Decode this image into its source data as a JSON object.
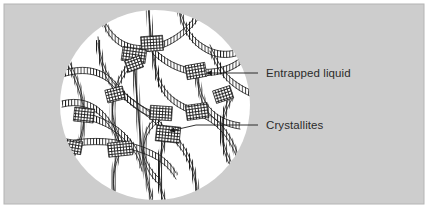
{
  "figure": {
    "panel": {
      "background_color": "#cdcdcd",
      "border_color": "#b4b4b4",
      "outer_background": "#ffffff",
      "x": 4,
      "y": 4,
      "width": 420,
      "height": 200
    },
    "circle": {
      "name": "specimen-field-of-view",
      "fill_color": "#ffffff",
      "cx": 155,
      "cy": 105,
      "r": 95
    },
    "ink_color": "#1a1a1a",
    "fibril_fill_color": "#ffffff",
    "junction_color": "#1f1f1f"
  },
  "annotations": [
    {
      "id": "entrapped-liquid",
      "label": "Entrapped liquid",
      "text_x": 266,
      "text_y": 77,
      "leader": {
        "x1": 258,
        "y1": 73,
        "x2": 205,
        "y2": 73
      },
      "arrow_tip": {
        "x": 203,
        "y": 73
      },
      "arrow_angle_deg": 180
    },
    {
      "id": "crystallites",
      "label": "Crystallites",
      "text_x": 266,
      "text_y": 129,
      "leader_segments": [
        {
          "x1": 258,
          "y1": 125,
          "x2": 196,
          "y2": 125
        },
        {
          "x1": 196,
          "y1": 125,
          "x2": 169,
          "y2": 131
        }
      ],
      "arrow_tip": {
        "x": 166,
        "y": 134
      },
      "arrow_angle_deg": 205
    }
  ],
  "legend_note": {
    "fibril_description": "ladder-textured ribbon chains",
    "junction_description": "dense cross-hatched crystallite blocks"
  }
}
